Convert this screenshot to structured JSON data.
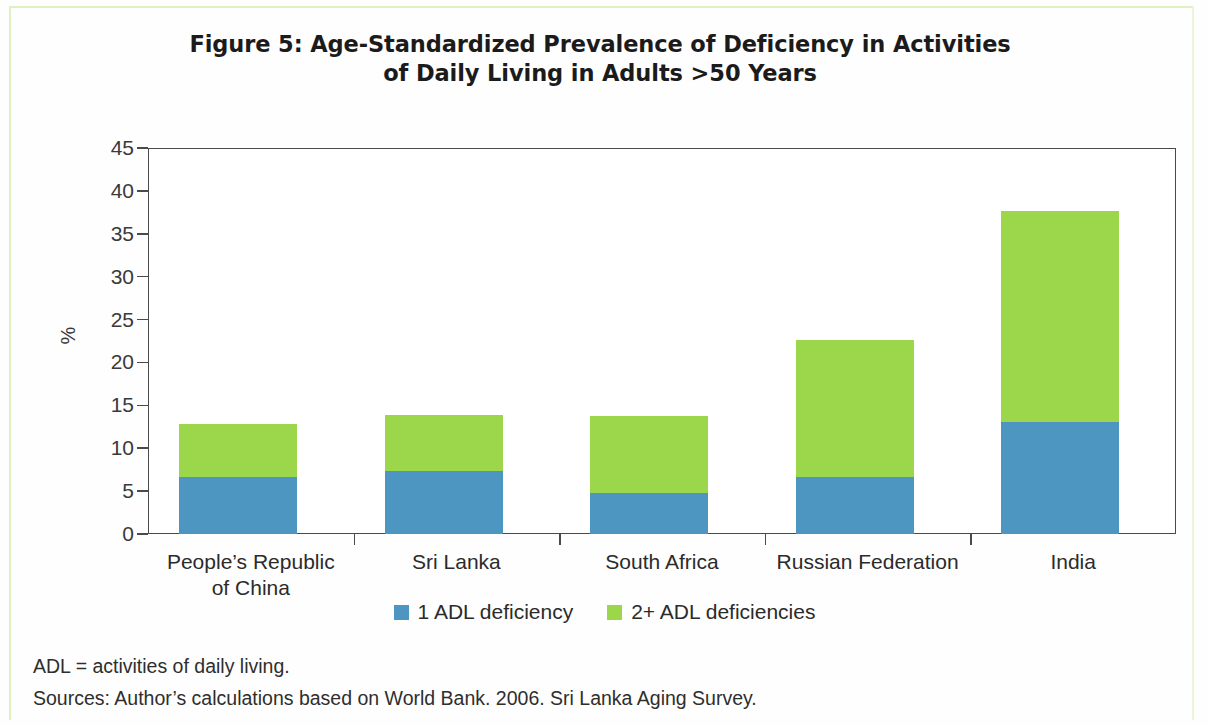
{
  "figure": {
    "title_line1": "Figure 5: Age-Standardized Prevalence of Deficiency in Activities",
    "title_line2": "of Daily Living in Adults >50 Years"
  },
  "notes": {
    "abbreviation": "ADL = activities of daily living.",
    "sources": "Sources: Author’s calculations based on World Bank. 2006. Sri Lanka Aging Survey."
  },
  "colors": {
    "series_1_adl": "#4d96c2",
    "series_2plus_adl": "#9cd64a",
    "axis": "#4a4a4a",
    "text": "#2b2b2b",
    "page_rule": "#dff0c2"
  },
  "chart_data": {
    "type": "bar",
    "stacked": true,
    "title": "Figure 5: Age-Standardized Prevalence of Deficiency in Activities of Daily Living in Adults >50 Years",
    "xlabel": "",
    "ylabel": "%",
    "ylim": [
      0,
      45
    ],
    "yticks": [
      0,
      5,
      10,
      15,
      20,
      25,
      30,
      35,
      40,
      45
    ],
    "ytick_labels": [
      "0",
      "5",
      "10",
      "15",
      "20",
      "25",
      "30",
      "35",
      "40",
      "45"
    ],
    "grid": false,
    "legend_position": "bottom",
    "categories": [
      "People’s Republic of China",
      "Sri Lanka",
      "South Africa",
      "Russian Federation",
      "India"
    ],
    "category_lines": [
      [
        "People’s Republic",
        "of China"
      ],
      [
        "Sri Lanka",
        ""
      ],
      [
        "South Africa",
        ""
      ],
      [
        "Russian Federation",
        ""
      ],
      [
        "India",
        ""
      ]
    ],
    "series": [
      {
        "name": "1 ADL deficiency",
        "color": "#4d96c2",
        "values": [
          6.6,
          7.3,
          4.8,
          6.7,
          13.1
        ]
      },
      {
        "name": "2+ ADL deficiencies",
        "color": "#9cd64a",
        "values": [
          6.2,
          6.6,
          9.0,
          15.9,
          24.6
        ]
      }
    ],
    "totals": [
      12.8,
      13.9,
      13.8,
      22.6,
      37.7
    ]
  }
}
